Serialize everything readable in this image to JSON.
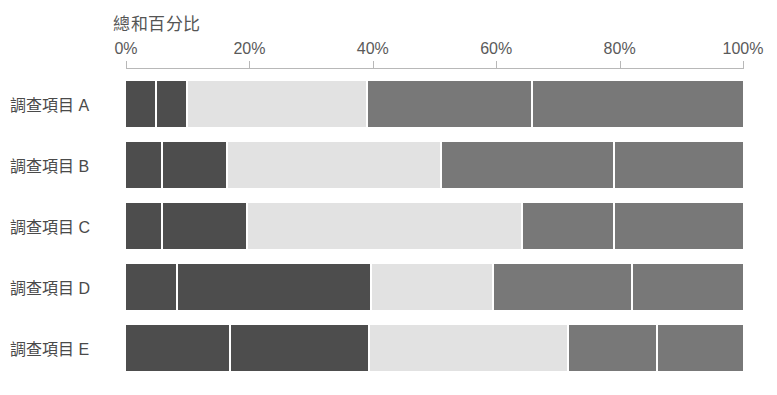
{
  "chart_data": {
    "type": "bar",
    "orientation": "horizontal",
    "stacked": true,
    "normalized": true,
    "title": "",
    "xlabel": "總和百分比",
    "ylabel": "",
    "xlim": [
      0,
      100
    ],
    "grid": false,
    "legend": "none",
    "xticks": [
      "0%",
      "20%",
      "40%",
      "60%",
      "80%",
      "100%"
    ],
    "xtick_values": [
      0,
      20,
      40,
      60,
      80,
      100
    ],
    "categories": [
      "調查項目 A",
      "調查項目 B",
      "調查項目 C",
      "調查項目 D",
      "調查項目 E"
    ],
    "series": [
      {
        "name": "段1",
        "color": "#4d4d4d",
        "values": [
          5.0,
          6.0,
          6.0,
          8.4,
          17.0
        ]
      },
      {
        "name": "段2",
        "color": "#4d4d4d",
        "values": [
          5.0,
          10.5,
          13.7,
          31.5,
          22.5
        ]
      },
      {
        "name": "段3",
        "color": "#e2e2e2",
        "values": [
          29.2,
          34.7,
          44.6,
          19.7,
          32.3
        ]
      },
      {
        "name": "段4",
        "color": "#787878",
        "values": [
          26.7,
          28.0,
          14.9,
          22.6,
          14.5
        ]
      },
      {
        "name": "段5",
        "color": "#787878",
        "values": [
          34.1,
          20.8,
          20.8,
          17.8,
          13.7
        ]
      }
    ],
    "bars": [
      {
        "category": "調查項目 A",
        "segments": [
          {
            "value": 5.0,
            "color": "#4d4d4d"
          },
          {
            "value": 5.0,
            "color": "#4d4d4d"
          },
          {
            "value": 29.2,
            "color": "#e2e2e2"
          },
          {
            "value": 26.7,
            "color": "#787878"
          },
          {
            "value": 34.1,
            "color": "#787878"
          }
        ]
      },
      {
        "category": "調查項目 B",
        "segments": [
          {
            "value": 6.0,
            "color": "#4d4d4d"
          },
          {
            "value": 10.5,
            "color": "#4d4d4d"
          },
          {
            "value": 34.7,
            "color": "#e2e2e2"
          },
          {
            "value": 28.0,
            "color": "#787878"
          },
          {
            "value": 20.8,
            "color": "#787878"
          }
        ]
      },
      {
        "category": "調查項目 C",
        "segments": [
          {
            "value": 6.0,
            "color": "#4d4d4d"
          },
          {
            "value": 13.7,
            "color": "#4d4d4d"
          },
          {
            "value": 44.6,
            "color": "#e2e2e2"
          },
          {
            "value": 14.9,
            "color": "#787878"
          },
          {
            "value": 20.8,
            "color": "#787878"
          }
        ]
      },
      {
        "category": "調查項目 D",
        "segments": [
          {
            "value": 8.4,
            "color": "#4d4d4d"
          },
          {
            "value": 31.5,
            "color": "#4d4d4d"
          },
          {
            "value": 19.7,
            "color": "#e2e2e2"
          },
          {
            "value": 22.6,
            "color": "#787878"
          },
          {
            "value": 17.8,
            "color": "#787878"
          }
        ]
      },
      {
        "category": "調查項目 E",
        "segments": [
          {
            "value": 17.0,
            "color": "#4d4d4d"
          },
          {
            "value": 22.5,
            "color": "#4d4d4d"
          },
          {
            "value": 32.3,
            "color": "#e2e2e2"
          },
          {
            "value": 14.5,
            "color": "#787878"
          },
          {
            "value": 13.7,
            "color": "#787878"
          }
        ]
      }
    ],
    "colors": {
      "dark": "#4d4d4d",
      "light": "#e2e2e2",
      "medium": "#787878",
      "axis": "#b8b8b8",
      "text": "#4a4a4a",
      "background": "#ffffff"
    }
  }
}
